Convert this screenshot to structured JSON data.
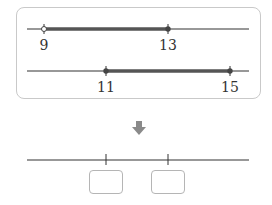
{
  "panel": {
    "line1": {
      "start": 9,
      "end": 13,
      "labels": [
        "9",
        "13"
      ]
    },
    "line2": {
      "start": 11,
      "end": 15,
      "labels": [
        "11",
        "15"
      ]
    }
  },
  "arrow": {
    "icon": "arrow-down-icon",
    "color": "#8a8a8a"
  },
  "result": {
    "tick_count": 2,
    "answer_boxes": [
      "",
      ""
    ]
  },
  "colors": {
    "line": "#333333",
    "highlight": "#555555",
    "box_border": "#c9c9c9"
  }
}
